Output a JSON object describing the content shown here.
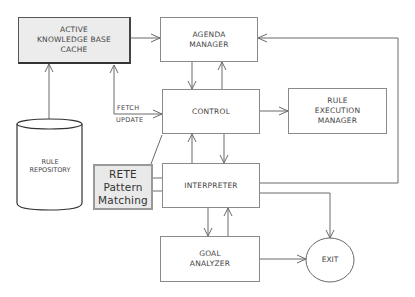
{
  "diagram": {
    "nodes": {
      "kb_cache": {
        "lines": [
          "ACTIVE",
          "KNOWLEDGE BASE",
          "CACHE"
        ]
      },
      "agenda": {
        "lines": [
          "AGENDA",
          "MANAGER"
        ]
      },
      "control": {
        "lines": [
          "CONTROL"
        ]
      },
      "rule_exec": {
        "lines": [
          "RULE",
          "EXECUTION",
          "MANAGER"
        ]
      },
      "repository": {
        "lines": [
          "RULE",
          "REPOSITORY"
        ]
      },
      "rete": {
        "lines": [
          "RETE",
          "Pattern",
          "Matching"
        ]
      },
      "interpreter": {
        "lines": [
          "INTERPRETER"
        ]
      },
      "goal": {
        "lines": [
          "GOAL",
          "ANALYZER"
        ]
      },
      "exit": {
        "label": "EXIT"
      }
    },
    "edge_labels": {
      "fetch": "FETCH",
      "update": "UPDATE"
    },
    "edges": [
      {
        "from": "RULE REPOSITORY",
        "to": "ACTIVE KNOWLEDGE BASE CACHE"
      },
      {
        "from": "ACTIVE KNOWLEDGE BASE CACHE",
        "to": "AGENDA MANAGER"
      },
      {
        "from": "CONTROL",
        "to": "ACTIVE KNOWLEDGE BASE CACHE",
        "label": "FETCH / UPDATE",
        "bidirectional": true
      },
      {
        "from": "AGENDA MANAGER",
        "to": "CONTROL"
      },
      {
        "from": "CONTROL",
        "to": "AGENDA MANAGER"
      },
      {
        "from": "CONTROL",
        "to": "RULE EXECUTION MANAGER"
      },
      {
        "from": "CONTROL",
        "to": "INTERPRETER"
      },
      {
        "from": "INTERPRETER",
        "to": "CONTROL"
      },
      {
        "from": "RETE Pattern Matching",
        "to": "CONTROL"
      },
      {
        "from": "RETE Pattern Matching",
        "to": "INTERPRETER"
      },
      {
        "from": "INTERPRETER",
        "to": "AGENDA MANAGER"
      },
      {
        "from": "INTERPRETER",
        "to": "EXIT"
      },
      {
        "from": "INTERPRETER",
        "to": "GOAL ANALYZER"
      },
      {
        "from": "GOAL ANALYZER",
        "to": "INTERPRETER"
      },
      {
        "from": "GOAL ANALYZER",
        "to": "EXIT"
      }
    ]
  }
}
